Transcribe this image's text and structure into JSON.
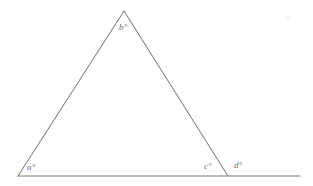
{
  "figure": {
    "background_color": "#ffffff",
    "stroke_color": "#6e6e6e",
    "baseline_color": "#7a7a7a",
    "stroke_width": 1,
    "label_color": "#6b6b6b",
    "canvas": {
      "width": 313,
      "height": 186
    }
  },
  "geometry": {
    "points": {
      "apex": {
        "name": "B",
        "x": 124,
        "y": 11
      },
      "left_vertex": {
        "name": "A",
        "x": 18,
        "y": 176
      },
      "right_vertex": {
        "name": "C",
        "x": 228,
        "y": 176
      },
      "baseline_start": {
        "x": 18,
        "y": 176
      },
      "baseline_end": {
        "x": 300,
        "y": 176
      }
    },
    "segments": [
      {
        "name": "left-side",
        "from": "left_vertex",
        "to": "apex"
      },
      {
        "name": "right-side",
        "from": "apex",
        "to": "right_vertex"
      },
      {
        "name": "baseline-ray",
        "from": "baseline_start",
        "to": "baseline_end"
      }
    ]
  },
  "labels": {
    "a": {
      "text": "a°",
      "x": 27,
      "y": 163,
      "meaning": "interior angle at left vertex"
    },
    "b": {
      "text": "b°",
      "x": 119,
      "y": 23,
      "meaning": "interior angle at apex"
    },
    "c": {
      "text": "c°",
      "x": 204,
      "y": 162,
      "meaning": "interior angle at right vertex"
    },
    "d": {
      "text": "d°",
      "x": 234,
      "y": 161,
      "meaning": "exterior angle at right vertex"
    }
  },
  "marks": {
    "speck": {
      "present": true,
      "x": 286,
      "y": 16
    }
  }
}
